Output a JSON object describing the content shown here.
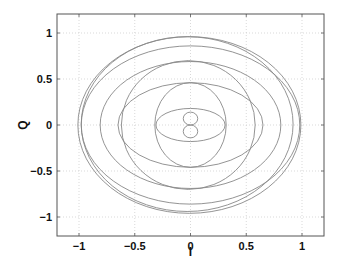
{
  "chart_data": {
    "type": "line",
    "title": "",
    "xlabel": "I",
    "ylabel": "Q",
    "xlim": [
      -1.2,
      1.2
    ],
    "ylim": [
      -1.2,
      1.2
    ],
    "grid": true,
    "xticks": [
      -1,
      -0.5,
      0,
      0.5,
      1
    ],
    "yticks": [
      -1,
      -0.5,
      0,
      0.5,
      1
    ],
    "xtick_labels": [
      "−1",
      "−0.5",
      "0",
      "0.5",
      "1"
    ],
    "ytick_labels": [
      "−1",
      "−0.5",
      "0",
      "0.5",
      "1"
    ],
    "legend": [],
    "series": [
      {
        "name": "curve-1",
        "shape": "ellipse",
        "cx": -0.01,
        "cy": 0.0,
        "rx": 1.0,
        "ry": 0.96
      },
      {
        "name": "curve-2",
        "shape": "ellipse",
        "cx": -0.03,
        "cy": 0.01,
        "rx": 0.95,
        "ry": 0.95
      },
      {
        "name": "curve-3",
        "shape": "ellipse",
        "cx": 0.0,
        "cy": 0.0,
        "rx": 0.98,
        "ry": 0.86
      },
      {
        "name": "curve-4",
        "shape": "ellipse",
        "cx": 0.0,
        "cy": 0.0,
        "rx": 0.81,
        "ry": 0.69
      },
      {
        "name": "curve-5",
        "shape": "ellipse",
        "cx": -0.02,
        "cy": 0.0,
        "rx": 0.6,
        "ry": 0.7
      },
      {
        "name": "curve-6",
        "shape": "ellipse",
        "cx": 0.0,
        "cy": 0.0,
        "rx": 0.65,
        "ry": 0.46
      },
      {
        "name": "curve-7",
        "shape": "ellipse",
        "cx": 0.0,
        "cy": 0.0,
        "rx": 0.32,
        "ry": 0.46
      },
      {
        "name": "curve-8",
        "shape": "ellipse",
        "cx": 0.0,
        "cy": 0.0,
        "rx": 0.31,
        "ry": 0.18
      },
      {
        "name": "curve-9",
        "shape": "circle",
        "cx": 0.0,
        "cy": 0.07,
        "rx": 0.065,
        "ry": 0.07
      },
      {
        "name": "curve-10",
        "shape": "circle",
        "cx": 0.0,
        "cy": -0.07,
        "rx": 0.065,
        "ry": 0.07
      }
    ],
    "line_color": "#888888"
  }
}
